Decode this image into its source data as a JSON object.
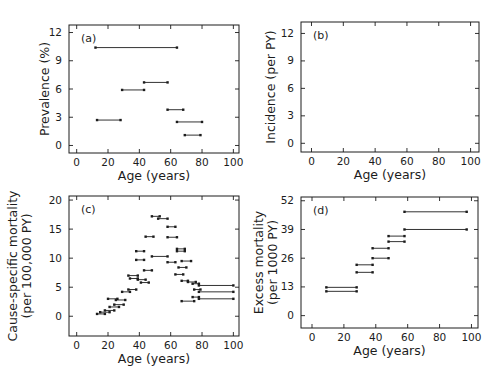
{
  "figure": {
    "background": "#ffffff",
    "ink_color": "#1c1c1c",
    "note": "Four-panel epidemiological rate figure; data shown as horizontal age-interval segments with small square end markers"
  },
  "chart_data": [
    {
      "id": "a",
      "tag": "(a)",
      "type": "scatter",
      "marker": "horizontal age-interval segment with square end caps",
      "title": "",
      "xlabel": "Age (years)",
      "ylabel": [
        "Prevalence (%)"
      ],
      "xticks": [
        0,
        20,
        40,
        60,
        80,
        100
      ],
      "yticks": [
        0,
        3,
        6,
        9,
        12
      ],
      "xlim": [
        -4.9,
        103.6
      ],
      "ylim": [
        -0.8,
        12.8
      ],
      "grid": false,
      "legend": null,
      "segments": [
        [
          12,
          64,
          10.4
        ],
        [
          13,
          28,
          2.7
        ],
        [
          29,
          43,
          5.9
        ],
        [
          43,
          58,
          6.7
        ],
        [
          58,
          68,
          3.8
        ],
        [
          64,
          80,
          2.5
        ],
        [
          69,
          79,
          1.1
        ]
      ]
    },
    {
      "id": "b",
      "tag": "(b)",
      "type": "scatter",
      "marker": "horizontal age-interval segment with square end caps",
      "title": "",
      "xlabel": "Age (years)",
      "ylabel": [
        "Incidence (per PY)"
      ],
      "xticks": [
        0,
        20,
        40,
        60,
        80,
        100
      ],
      "yticks": [
        0,
        3,
        6,
        9,
        12
      ],
      "xlim": [
        -6.6,
        105.3
      ],
      "ylim": [
        -0.95,
        13.25
      ],
      "grid": false,
      "legend": null,
      "segments": []
    },
    {
      "id": "c",
      "tag": "(c)",
      "type": "scatter",
      "marker": "horizontal age-interval segment with square end caps",
      "title": "",
      "xlabel": "Age (years)",
      "ylabel": [
        "Cause-specific mortality",
        "(per 100,000 PY)"
      ],
      "xticks": [
        0,
        20,
        40,
        60,
        80,
        100
      ],
      "yticks": [
        0,
        5,
        10,
        15,
        20
      ],
      "xlim": [
        -4.9,
        103.6
      ],
      "ylim": [
        -3.4,
        20.7
      ],
      "grid": false,
      "legend": null,
      "segments": [
        [
          13,
          18,
          0.4
        ],
        [
          15,
          21,
          0.7
        ],
        [
          18,
          24,
          1.0
        ],
        [
          21,
          27,
          1.6
        ],
        [
          24,
          30,
          2.0
        ],
        [
          20,
          26,
          3.0
        ],
        [
          25,
          31,
          2.8
        ],
        [
          29,
          34,
          4.2
        ],
        [
          33,
          38,
          4.6
        ],
        [
          33,
          39,
          7.0
        ],
        [
          34,
          39,
          6.5
        ],
        [
          39,
          44,
          6.3
        ],
        [
          41,
          46,
          5.8
        ],
        [
          43,
          48,
          7.9
        ],
        [
          38,
          43,
          9.7
        ],
        [
          38,
          43,
          11.2
        ],
        [
          44,
          49,
          13.7
        ],
        [
          48,
          53,
          17.2
        ],
        [
          52,
          58,
          16.8
        ],
        [
          48,
          58,
          10.3
        ],
        [
          58,
          63,
          15.4
        ],
        [
          58,
          64,
          13.6
        ],
        [
          58,
          63,
          9.3
        ],
        [
          64,
          69,
          11.6
        ],
        [
          64,
          69,
          11.2
        ],
        [
          63,
          68,
          7.2
        ],
        [
          65,
          70,
          8.4
        ],
        [
          67,
          73,
          9.5
        ],
        [
          67,
          71,
          6.1
        ],
        [
          71,
          76,
          5.9
        ],
        [
          67,
          75,
          2.6
        ],
        [
          74,
          78,
          5.6
        ],
        [
          75,
          79,
          4.6
        ],
        [
          74,
          78,
          3.3
        ],
        [
          78,
          100,
          5.3
        ],
        [
          78,
          100,
          4.2
        ],
        [
          78,
          100,
          3.0
        ]
      ]
    },
    {
      "id": "d",
      "tag": "(d)",
      "type": "scatter",
      "marker": "horizontal age-interval segment with square end caps",
      "title": "",
      "xlabel": "Age (years)",
      "ylabel": [
        "Excess mortality",
        "(per 1000 PY)"
      ],
      "xticks": [
        0,
        20,
        40,
        60,
        80,
        100
      ],
      "yticks": [
        0,
        13,
        26,
        39,
        52
      ],
      "xlim": [
        -6.9,
        104.1
      ],
      "ylim": [
        -5.6,
        53.7
      ],
      "grid": false,
      "legend": null,
      "segments": [
        [
          9,
          28,
          12.8
        ],
        [
          9,
          28,
          11.0
        ],
        [
          28,
          38,
          23.0
        ],
        [
          28,
          38,
          19.6
        ],
        [
          38,
          48,
          30.5
        ],
        [
          38,
          48,
          26.0
        ],
        [
          48,
          58,
          36.0
        ],
        [
          48,
          58,
          33.5
        ],
        [
          58,
          97,
          47.0
        ],
        [
          58,
          97,
          39.0
        ]
      ]
    }
  ]
}
